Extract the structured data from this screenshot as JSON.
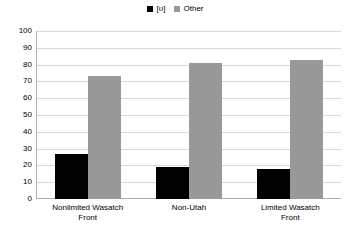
{
  "chart_data": {
    "type": "bar",
    "title": "",
    "xlabel": "",
    "ylabel": "",
    "ylim": [
      0,
      100
    ],
    "ytick_step": 10,
    "yticks": [
      "100",
      "90",
      "80",
      "70",
      "60",
      "50",
      "40",
      "30",
      "20",
      "10",
      "0"
    ],
    "grid": true,
    "legend_position": "top-center",
    "categories": [
      "Nonlimited Wasatch\nFront",
      "Non-Utah",
      "Limited Wasatch\nFront"
    ],
    "series": [
      {
        "name": "[ʊ]",
        "color": "#000000",
        "values": [
          27,
          19,
          18
        ]
      },
      {
        "name": "Other",
        "color": "#999999",
        "values": [
          73,
          81,
          83
        ]
      }
    ]
  },
  "colors": {
    "series_one": "#000000",
    "series_two": "#999999",
    "gridline": "#d8d8d8",
    "axis": "#b0b0b0",
    "background": "#ffffff",
    "text": "#000000"
  }
}
